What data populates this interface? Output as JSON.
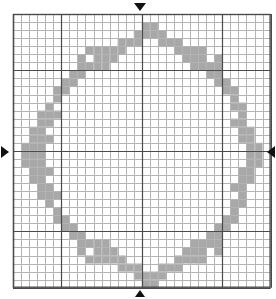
{
  "document": {
    "title": "Cross-stitch Chart",
    "type": "stitch-grid-chart"
  },
  "watermarks": [
    {
      "id": "wm-left",
      "text": ""
    },
    {
      "id": "wm-mid",
      "text": ""
    }
  ],
  "markers": {
    "top": {
      "name": "center-marker-top",
      "glyph": "▼",
      "direction": "down",
      "column": 16
    },
    "bottom": {
      "name": "center-marker-bottom",
      "glyph": "▲",
      "direction": "up",
      "column": 16
    },
    "left": {
      "name": "center-marker-left",
      "glyph": "▶",
      "direction": "right",
      "row": 17
    },
    "right": {
      "name": "center-marker-right",
      "glyph": "◀",
      "direction": "left",
      "row": 17
    }
  },
  "chart_data": {
    "type": "heatmap",
    "title": "",
    "subtitle": "",
    "xlabel": "",
    "ylabel": "",
    "grid": true,
    "legend_position": "none",
    "columns": 32,
    "rows": 34,
    "cell_size": 8.05,
    "origin": {
      "x": 12,
      "y": 13
    },
    "colors": {
      "background": "#ffffff",
      "fill": "#a8a8a8",
      "minor_line": "#b4b4b4",
      "major_line": "#4a4a4a",
      "border": "#4a4a4a",
      "marker": "#111111"
    },
    "major_line_every": 10,
    "major_offset_cols": [
      0,
      6,
      16,
      26,
      32
    ],
    "major_offset_rows": [
      0,
      7,
      17,
      27,
      34
    ],
    "categories": [],
    "values": [],
    "filled_cells": [
      [
        16,
        1
      ],
      [
        17,
        1
      ],
      [
        15,
        2
      ],
      [
        16,
        2
      ],
      [
        17,
        2
      ],
      [
        18,
        2
      ],
      [
        13,
        3
      ],
      [
        14,
        3
      ],
      [
        15,
        3
      ],
      [
        18,
        3
      ],
      [
        19,
        3
      ],
      [
        20,
        3
      ],
      [
        9,
        4
      ],
      [
        10,
        4
      ],
      [
        11,
        4
      ],
      [
        12,
        4
      ],
      [
        13,
        4
      ],
      [
        20,
        4
      ],
      [
        21,
        4
      ],
      [
        22,
        4
      ],
      [
        23,
        4
      ],
      [
        8,
        5
      ],
      [
        10,
        5
      ],
      [
        11,
        5
      ],
      [
        12,
        5
      ],
      [
        21,
        5
      ],
      [
        22,
        5
      ],
      [
        23,
        5
      ],
      [
        25,
        5
      ],
      [
        8,
        6
      ],
      [
        9,
        6
      ],
      [
        10,
        6
      ],
      [
        11,
        6
      ],
      [
        22,
        6
      ],
      [
        23,
        6
      ],
      [
        24,
        6
      ],
      [
        25,
        6
      ],
      [
        7,
        7
      ],
      [
        8,
        7
      ],
      [
        24,
        7
      ],
      [
        25,
        7
      ],
      [
        6,
        8
      ],
      [
        7,
        8
      ],
      [
        25,
        8
      ],
      [
        26,
        8
      ],
      [
        5,
        9
      ],
      [
        6,
        9
      ],
      [
        26,
        9
      ],
      [
        27,
        9
      ],
      [
        5,
        10
      ],
      [
        27,
        10
      ],
      [
        4,
        11
      ],
      [
        27,
        11
      ],
      [
        28,
        11
      ],
      [
        3,
        12
      ],
      [
        4,
        12
      ],
      [
        5,
        12
      ],
      [
        28,
        12
      ],
      [
        3,
        13
      ],
      [
        4,
        13
      ],
      [
        27,
        13
      ],
      [
        28,
        13
      ],
      [
        2,
        14
      ],
      [
        3,
        14
      ],
      [
        28,
        14
      ],
      [
        29,
        14
      ],
      [
        2,
        15
      ],
      [
        3,
        15
      ],
      [
        4,
        15
      ],
      [
        28,
        15
      ],
      [
        29,
        15
      ],
      [
        1,
        16
      ],
      [
        2,
        16
      ],
      [
        3,
        16
      ],
      [
        29,
        16
      ],
      [
        30,
        16
      ],
      [
        1,
        17
      ],
      [
        2,
        17
      ],
      [
        3,
        17
      ],
      [
        29,
        17
      ],
      [
        30,
        17
      ],
      [
        1,
        18
      ],
      [
        2,
        18
      ],
      [
        3,
        18
      ],
      [
        29,
        18
      ],
      [
        30,
        18
      ],
      [
        2,
        19
      ],
      [
        3,
        19
      ],
      [
        4,
        19
      ],
      [
        28,
        19
      ],
      [
        29,
        19
      ],
      [
        2,
        20
      ],
      [
        3,
        20
      ],
      [
        28,
        20
      ],
      [
        29,
        20
      ],
      [
        3,
        21
      ],
      [
        4,
        21
      ],
      [
        27,
        21
      ],
      [
        28,
        21
      ],
      [
        3,
        22
      ],
      [
        4,
        22
      ],
      [
        5,
        22
      ],
      [
        28,
        22
      ],
      [
        4,
        23
      ],
      [
        27,
        23
      ],
      [
        28,
        23
      ],
      [
        5,
        24
      ],
      [
        27,
        24
      ],
      [
        5,
        25
      ],
      [
        6,
        25
      ],
      [
        26,
        25
      ],
      [
        27,
        25
      ],
      [
        6,
        26
      ],
      [
        7,
        26
      ],
      [
        25,
        26
      ],
      [
        26,
        26
      ],
      [
        7,
        27
      ],
      [
        8,
        27
      ],
      [
        24,
        27
      ],
      [
        25,
        27
      ],
      [
        8,
        28
      ],
      [
        9,
        28
      ],
      [
        10,
        28
      ],
      [
        11,
        28
      ],
      [
        22,
        28
      ],
      [
        23,
        28
      ],
      [
        24,
        28
      ],
      [
        25,
        28
      ],
      [
        8,
        29
      ],
      [
        10,
        29
      ],
      [
        11,
        29
      ],
      [
        12,
        29
      ],
      [
        21,
        29
      ],
      [
        22,
        29
      ],
      [
        23,
        29
      ],
      [
        25,
        29
      ],
      [
        9,
        30
      ],
      [
        10,
        30
      ],
      [
        11,
        30
      ],
      [
        12,
        30
      ],
      [
        13,
        30
      ],
      [
        20,
        30
      ],
      [
        21,
        30
      ],
      [
        22,
        30
      ],
      [
        23,
        30
      ],
      [
        13,
        31
      ],
      [
        14,
        31
      ],
      [
        15,
        31
      ],
      [
        18,
        31
      ],
      [
        19,
        31
      ],
      [
        20,
        31
      ],
      [
        15,
        32
      ],
      [
        16,
        32
      ],
      [
        17,
        32
      ],
      [
        18,
        32
      ],
      [
        16,
        33
      ],
      [
        17,
        33
      ]
    ]
  }
}
